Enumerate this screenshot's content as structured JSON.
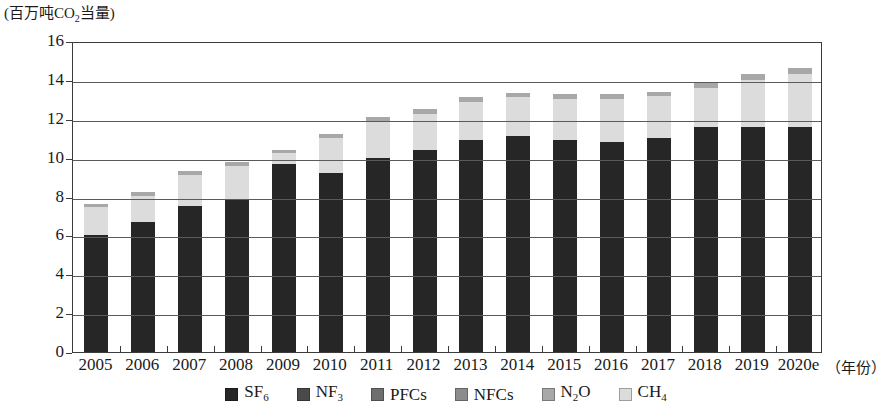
{
  "chart_data": {
    "type": "bar",
    "stacked": true,
    "title": "",
    "subtitle": "",
    "ylabel": "(百万吨CO₂当量)",
    "xlabel": "（年份）",
    "ylim": [
      0,
      16
    ],
    "ytick_step": 2,
    "yticks": [
      "0",
      "2",
      "4",
      "6",
      "8",
      "10",
      "12",
      "14",
      "16"
    ],
    "grid": true,
    "legend_position": "bottom",
    "categories": [
      "2005",
      "2006",
      "2007",
      "2008",
      "2009",
      "2010",
      "2011",
      "2012",
      "2013",
      "2014",
      "2015",
      "2016",
      "2017",
      "2018",
      "2019",
      "2020e"
    ],
    "series": [
      {
        "name": "SF₆",
        "color": "#262626",
        "values": [
          6.0,
          6.7,
          7.5,
          7.8,
          9.65,
          9.2,
          10.0,
          10.4,
          10.9,
          11.1,
          10.9,
          10.8,
          11.0,
          11.6,
          11.6,
          11.6
        ]
      },
      {
        "name": "NF₃",
        "color": "#4a4a4a",
        "values": [
          0,
          0,
          0,
          0,
          0,
          0,
          0,
          0,
          0,
          0,
          0,
          0,
          0,
          0,
          0,
          0
        ]
      },
      {
        "name": "PFCs",
        "color": "#6e6e6e",
        "values": [
          0,
          0,
          0,
          0,
          0,
          0,
          0,
          0,
          0,
          0,
          0,
          0,
          0,
          0,
          0,
          0
        ]
      },
      {
        "name": "NFCs",
        "color": "#8c8c8c",
        "values": [
          0,
          0,
          0,
          0,
          0,
          0,
          0,
          0,
          0,
          0,
          0,
          0,
          0,
          0,
          0,
          0
        ]
      },
      {
        "name": "N₂O",
        "color": "#a8a8a8",
        "values": [
          0.15,
          0.2,
          0.2,
          0.2,
          0.15,
          0.2,
          0.25,
          0.25,
          0.25,
          0.25,
          0.25,
          0.25,
          0.25,
          0.25,
          0.3,
          0.3
        ]
      },
      {
        "name": "CH₄",
        "color": "#dcdcdc",
        "values": [
          1.45,
          1.35,
          1.6,
          1.75,
          0.6,
          1.8,
          1.85,
          1.85,
          1.95,
          2.0,
          2.1,
          2.2,
          2.15,
          2.0,
          2.4,
          2.7
        ]
      }
    ],
    "stack_order": [
      "SF₆",
      "NF₃",
      "PFCs",
      "NFCs",
      "CH₄",
      "N₂O"
    ],
    "totals": [
      7.6,
      8.25,
      9.3,
      9.75,
      10.4,
      11.2,
      12.1,
      12.5,
      13.1,
      13.35,
      13.25,
      13.25,
      13.4,
      13.85,
      14.3,
      14.6
    ],
    "legend": [
      {
        "label": "SF₆",
        "color": "#262626"
      },
      {
        "label": "NF₃",
        "color": "#4a4a4a"
      },
      {
        "label": "PFCs",
        "color": "#6e6e6e"
      },
      {
        "label": "NFCs",
        "color": "#8c8c8c"
      },
      {
        "label": "N₂O",
        "color": "#a8a8a8"
      },
      {
        "label": "CH₄",
        "color": "#dcdcdc"
      }
    ]
  }
}
